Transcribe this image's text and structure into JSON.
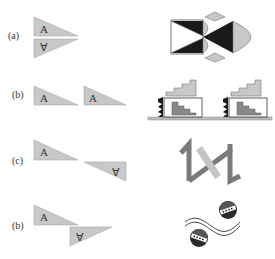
{
  "figure": {
    "rows": [
      {
        "label": "(a)",
        "left_description": "two right triangles mirrored across a horizontal axis forming an arrowhead",
        "triangle_letters": [
          "A",
          "∀"
        ],
        "right_icon": "bowtie-reflection-pattern-icon"
      },
      {
        "label": "(b)",
        "left_description": "two identical triangles translated horizontally",
        "triangle_letters": [
          "A",
          "A"
        ],
        "right_icon": "repeated-stairs-translation-icon"
      },
      {
        "label": "(c)",
        "left_description": "triangle and its 180-degree rotation",
        "triangle_letters": [
          "A",
          "∀"
        ],
        "right_icon": "rotated-zigzag-pattern-icon"
      },
      {
        "label": "(b)",
        "left_description": "triangle and its glide reflection",
        "triangle_letters": [
          "A",
          "∀"
        ],
        "right_icon": "wave-and-balls-glide-icon"
      }
    ]
  },
  "colors": {
    "triangle_fill": "#c8c8c8",
    "triangle_stroke": "#999999",
    "dark": "#1a1a1a",
    "mid_gray": "#7a7a7a",
    "light_gray": "#bdbdbd"
  }
}
